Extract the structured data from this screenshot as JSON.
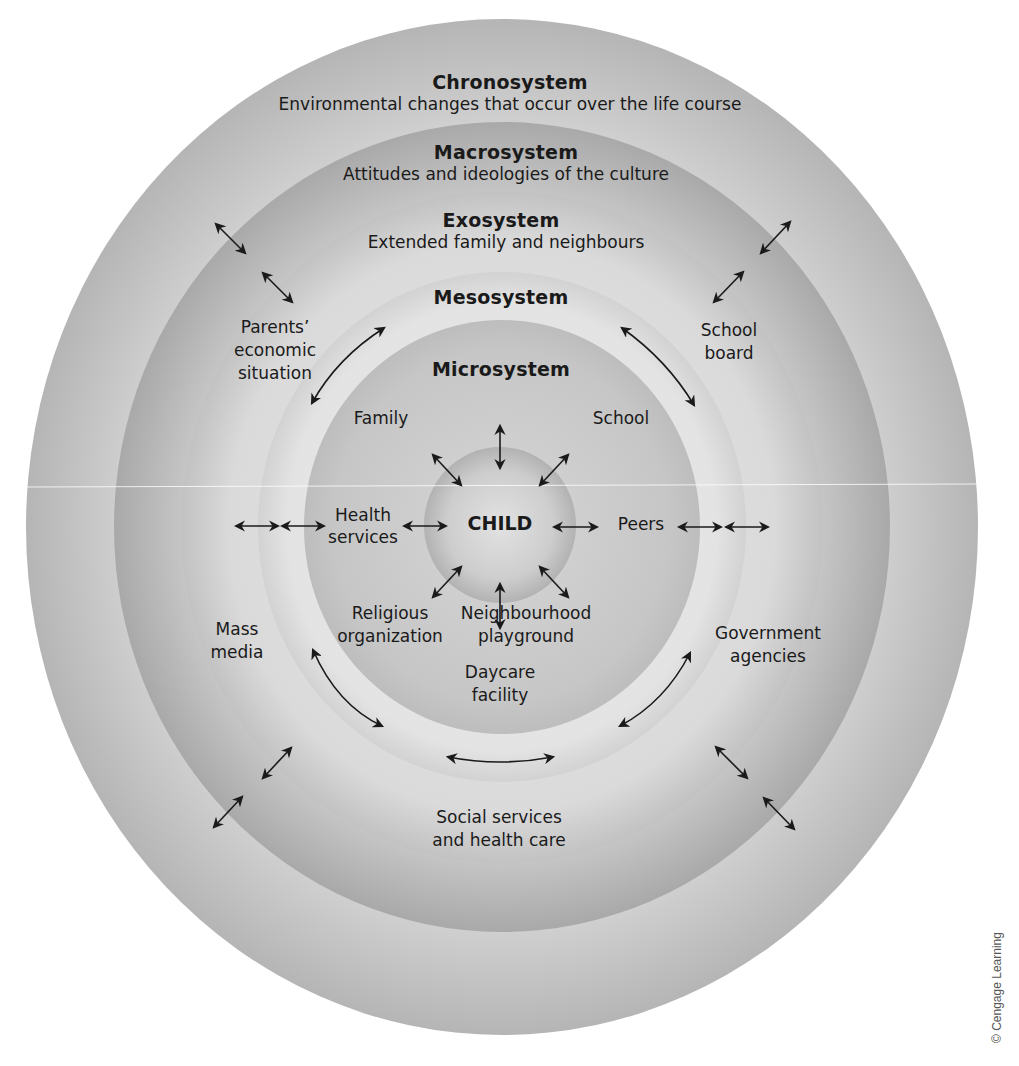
{
  "diagram": {
    "type": "concentric-circles",
    "layers": [
      {
        "id": "chronosystem",
        "title": "Chronosystem",
        "description": "Environmental changes that occur over the life course",
        "fill_center": "#d4d4d4",
        "fill_edge": "#b8b8b8"
      },
      {
        "id": "macrosystem",
        "title": "Macrosystem",
        "description": "Attitudes and ideologies of the culture",
        "fill_center": "#d0d0d0",
        "fill_edge": "#a8a8a8"
      },
      {
        "id": "exosystem",
        "title": "Exosystem",
        "description": "Extended family and neighbours",
        "fill_center": "#dcdcdc",
        "fill_edge": "#c4c4c4"
      },
      {
        "id": "mesosystem",
        "title": "Mesosystem",
        "description": "",
        "fill_center": "#e2e2e2",
        "fill_edge": "#d0d0d0"
      },
      {
        "id": "microsystem",
        "title": "Microsystem",
        "description": "",
        "fill_center": "#c8c8c8",
        "fill_edge": "#bcbcbc"
      },
      {
        "id": "child",
        "title": "CHILD",
        "description": "",
        "fill_center": "#dddddd",
        "fill_edge": "#b4b4b4"
      }
    ],
    "microsystem_items": {
      "family": "Family",
      "school": "School",
      "health_services_1": "Health",
      "health_services_2": "services",
      "peers": "Peers",
      "religious_1": "Religious",
      "religious_2": "organization",
      "neighbourhood_1": "Neighbourhood",
      "neighbourhood_2": "playground",
      "daycare_1": "Daycare",
      "daycare_2": "facility"
    },
    "exosystem_items": {
      "parents_1": "Parents’",
      "parents_2": "economic",
      "parents_3": "situation",
      "school_board_1": "School",
      "school_board_2": "board",
      "mass_media_1": "Mass",
      "mass_media_2": "media",
      "government_1": "Government",
      "government_2": "agencies",
      "social_1": "Social services",
      "social_2": "and health care"
    },
    "arrow_color": "#1a1a1a",
    "copyright": "© Cengage Learning"
  }
}
